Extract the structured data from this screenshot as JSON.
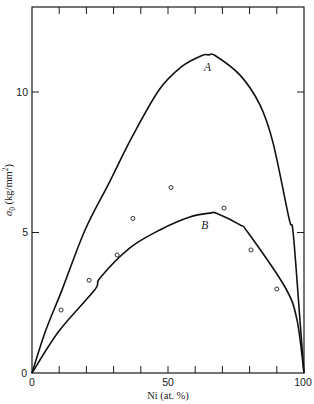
{
  "chart_data": {
    "type": "line",
    "title": "",
    "xlabel": "Ni (at. %)",
    "ylabel": "σ0 (kg/mm²)",
    "ylabel_main": "σ",
    "ylabel_sub": "0",
    "ylabel_rest": " (kg/mm",
    "ylabel_sup": "2",
    "ylabel_end": ")",
    "xlim": [
      0,
      100
    ],
    "ylim": [
      0,
      13
    ],
    "x_tick_labels": [
      "0",
      "50",
      "100"
    ],
    "x_ticks": [
      0,
      10,
      20,
      30,
      40,
      50,
      60,
      70,
      80,
      90,
      100
    ],
    "y_tick_labels": [
      "0",
      "5",
      "10"
    ],
    "y_ticks": [
      0,
      5,
      10
    ],
    "grid": false,
    "legend": null,
    "series": [
      {
        "name": "A",
        "kind": "curve",
        "label_pos": [
          64.5,
          10.9
        ],
        "x": [
          0,
          5,
          11,
          19.5,
          28.3,
          36.8,
          46.7,
          55,
          62.5,
          65,
          67.3,
          76.5,
          83.8,
          88.6,
          94.5,
          96,
          98.5,
          100
        ],
        "values": [
          0,
          1.5,
          2.95,
          5.09,
          6.76,
          8.4,
          10.07,
          10.9,
          11.3,
          11.32,
          11.3,
          10.6,
          9.54,
          8.2,
          5.5,
          5.0,
          1.9,
          0
        ]
      },
      {
        "name": "B",
        "kind": "curve",
        "label_pos": [
          63.5,
          5.25
        ],
        "x": [
          0,
          10,
          23,
          25,
          36,
          47,
          58,
          65.4,
          68,
          76.5,
          79.4,
          93,
          97.4,
          100
        ],
        "values": [
          0,
          1.5,
          2.95,
          3.38,
          4.45,
          5.09,
          5.55,
          5.69,
          5.68,
          5.27,
          5.0,
          3.06,
          1.9,
          0
        ]
      },
      {
        "name": "measured",
        "kind": "scatter",
        "x": [
          10.7,
          21,
          31.3,
          37.1,
          51.1,
          70.6,
          80.5,
          90
        ],
        "values": [
          2.24,
          3.3,
          4.2,
          5.5,
          6.6,
          5.87,
          4.38,
          2.99
        ]
      }
    ]
  }
}
